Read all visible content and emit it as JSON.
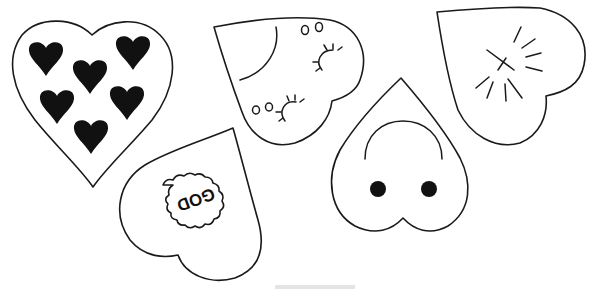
{
  "canvas": {
    "width": 591,
    "height": 293,
    "background": "#ffffff"
  },
  "colors": {
    "stroke": "#1a1a1a",
    "fill": "#111111"
  },
  "hearts": [
    {
      "id": "heart-filled-hearts",
      "description": "Heart outline containing six small solid black hearts",
      "inner_hearts": 6
    },
    {
      "id": "heart-god",
      "description": "Tilted heart with scalloped cloud badge",
      "label": "GOD",
      "label_rotation_deg": 160
    },
    {
      "id": "heart-ladybug-eyes",
      "description": "Tilted heart with curved arc, small ovals and eyelash marks",
      "oval_pairs": 2,
      "eyelash_arcs": 2
    },
    {
      "id": "heart-face",
      "description": "Inverted heart with arc and two black dots",
      "dots": 2
    },
    {
      "id": "heart-sparkle",
      "description": "Tilted heart with cross and radiating sparkle lines",
      "ray_count": 8
    }
  ]
}
